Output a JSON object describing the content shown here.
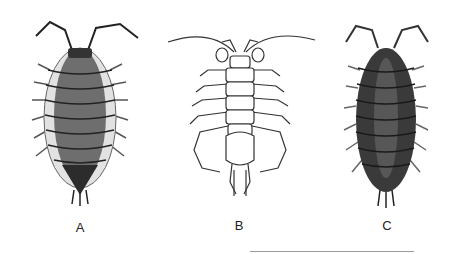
{
  "figure": {
    "specimens": [
      {
        "id": "A",
        "label": "A",
        "style": "stippled, medium-dark grey body with pale lateral plates",
        "body_color": "#6e6e6e",
        "edge_color": "#e2e2e2"
      },
      {
        "id": "B",
        "label": "B",
        "style": "outline drawing, long legs and long antennae, no shading",
        "body_color": "#ffffff",
        "edge_color": "#333333"
      },
      {
        "id": "C",
        "label": "C",
        "style": "dark stippled oval body",
        "body_color": "#3a3a3a",
        "edge_color": "#1a1a1a"
      }
    ],
    "colors": {
      "background": "#ffffff",
      "ink": "#222222",
      "rule": "#9a9a9a"
    }
  }
}
